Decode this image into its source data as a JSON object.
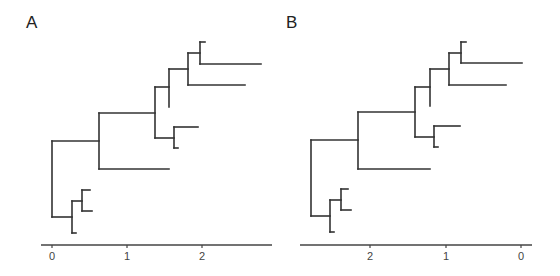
{
  "figure": {
    "panels": [
      {
        "id": "A",
        "label": "A",
        "axis": {
          "y": 245,
          "x_start": 41,
          "x_end": 272,
          "direction": "increasing",
          "ticks": [
            {
              "label": "0",
              "x": 52
            },
            {
              "label": "1",
              "x": 127
            },
            {
              "label": "2",
              "x": 202
            }
          ]
        },
        "segments": [
          [
            52,
            141,
            52,
            217
          ],
          [
            52,
            141,
            99,
            141
          ],
          [
            52,
            217,
            72,
            217
          ],
          [
            99,
            113,
            99,
            169
          ],
          [
            99,
            113,
            155,
            113
          ],
          [
            99,
            169,
            169,
            169
          ],
          [
            155,
            87,
            155,
            138
          ],
          [
            155,
            87,
            169,
            87
          ],
          [
            155,
            138,
            174,
            138
          ],
          [
            169,
            69,
            169,
            107
          ],
          [
            169,
            69,
            188,
            69
          ],
          [
            188,
            53,
            188,
            85
          ],
          [
            188,
            53,
            200,
            53
          ],
          [
            188,
            85,
            245,
            85
          ],
          [
            200,
            42,
            200,
            64
          ],
          [
            200,
            42,
            205,
            42
          ],
          [
            200,
            64,
            261,
            64
          ],
          [
            174,
            127,
            174,
            148
          ],
          [
            174,
            127,
            198,
            127
          ],
          [
            174,
            148,
            178,
            148
          ],
          [
            72,
            201,
            72,
            233
          ],
          [
            72,
            233,
            76,
            233
          ],
          [
            72,
            201,
            82,
            201
          ],
          [
            82,
            190,
            82,
            211
          ],
          [
            82,
            190,
            90,
            190
          ],
          [
            82,
            211,
            92,
            211
          ]
        ]
      },
      {
        "id": "B",
        "label": "B",
        "axis": {
          "y": 245,
          "x_start": 300,
          "x_end": 532,
          "direction": "decreasing",
          "ticks": [
            {
              "label": "2",
              "x": 370
            },
            {
              "label": "1",
              "x": 446
            },
            {
              "label": "0",
              "x": 521
            }
          ]
        },
        "segments": [
          [
            311,
            140,
            311,
            216
          ],
          [
            311,
            140,
            358,
            140
          ],
          [
            311,
            216,
            330,
            216
          ],
          [
            358,
            112,
            358,
            169
          ],
          [
            358,
            112,
            415,
            112
          ],
          [
            358,
            169,
            430,
            169
          ],
          [
            415,
            87,
            415,
            137
          ],
          [
            415,
            87,
            430,
            87
          ],
          [
            415,
            137,
            434,
            137
          ],
          [
            430,
            69,
            430,
            106
          ],
          [
            430,
            69,
            449,
            69
          ],
          [
            449,
            53,
            449,
            85
          ],
          [
            449,
            53,
            461,
            53
          ],
          [
            449,
            85,
            506,
            85
          ],
          [
            461,
            42,
            461,
            63
          ],
          [
            461,
            42,
            466,
            42
          ],
          [
            461,
            63,
            522,
            63
          ],
          [
            434,
            126,
            434,
            147
          ],
          [
            434,
            126,
            460,
            126
          ],
          [
            434,
            147,
            438,
            147
          ],
          [
            330,
            200,
            330,
            232
          ],
          [
            330,
            232,
            334,
            232
          ],
          [
            330,
            200,
            341,
            200
          ],
          [
            341,
            189,
            341,
            210
          ],
          [
            341,
            189,
            348,
            189
          ],
          [
            341,
            210,
            351,
            210
          ]
        ]
      }
    ],
    "style": {
      "line_color": "#333333",
      "axis_color": "#444444",
      "line_width": 1.6
    }
  }
}
